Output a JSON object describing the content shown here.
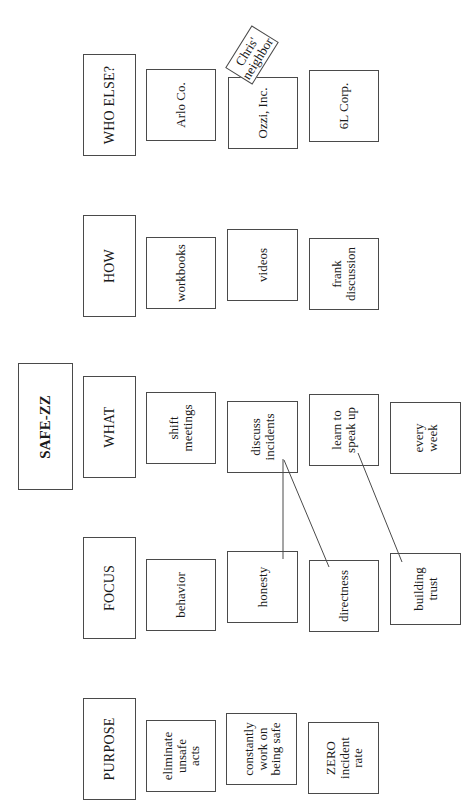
{
  "title": "SAFE-ZZ",
  "columns": [
    {
      "header": "WHO ELSE?",
      "items": [
        "Arlo Co.",
        "Ozzi, Inc.",
        "6L Corp."
      ]
    },
    {
      "header": "HOW",
      "items": [
        "workbooks",
        "videos",
        "frank\ndiscussion"
      ]
    },
    {
      "header": "WHAT",
      "items": [
        "shift\nmeetings",
        "discuss\nincidents",
        "learn to\nspeak up",
        "every\nweek"
      ]
    },
    {
      "header": "FOCUS",
      "items": [
        "behavior",
        "honesty",
        "directness",
        "building\ntrust"
      ]
    },
    {
      "header": "PURPOSE",
      "items": [
        "eliminate\nunsafe\nacts",
        "constantly\nwork on\nbeing safe",
        "ZERO\nincident\nrate"
      ]
    }
  ],
  "sticky_note": {
    "text": "Chris'\nneighbor",
    "attached_to": "Ozzi, Inc."
  },
  "connections": [
    {
      "from": "discuss incidents",
      "to": "honesty"
    },
    {
      "from": "discuss incidents",
      "to": "directness"
    },
    {
      "from": "learn to speak up",
      "to": "building trust"
    }
  ],
  "colors": {
    "line": "#4a4a4a",
    "background": "#ffffff",
    "text": "#1a1a1a"
  }
}
